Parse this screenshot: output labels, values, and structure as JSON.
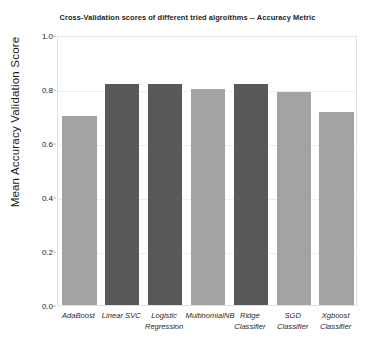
{
  "chart_data": {
    "type": "bar",
    "title": "Cross-Validation scores of different tried algroithms -- Accuracy Metric",
    "xlabel": "",
    "ylabel": "Mean Accuracy Validation Score",
    "categories": [
      "AdaBoost",
      "Linear SVC",
      "Logistic\nRegression",
      "MultinomialNB",
      "Ridge\nClassifier",
      "SGD\nClassifier",
      "Xgboost\nClassifier"
    ],
    "values": [
      0.7,
      0.82,
      0.82,
      0.8,
      0.82,
      0.79,
      0.715
    ],
    "bar_colors": [
      "#a3a3a3",
      "#585858",
      "#585858",
      "#a3a3a3",
      "#585858",
      "#a3a3a3",
      "#a3a3a3"
    ],
    "ylim": [
      0.0,
      1.0
    ],
    "yticks": [
      "0.0",
      "0.2",
      "0.4",
      "0.6",
      "0.8",
      "1.0"
    ],
    "ytick_values": [
      0.0,
      0.2,
      0.4,
      0.6,
      0.8,
      1.0
    ],
    "grid": true,
    "legend": null,
    "background_color": "#ffffff",
    "frame_color": "#e2e2e2"
  }
}
